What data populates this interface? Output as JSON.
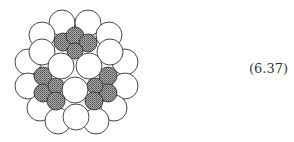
{
  "equation_label": "(6.37)",
  "colors": {
    "white_atom": "#ffffff",
    "stroke": "#333333",
    "hatched_atom": "#8c8c8c"
  },
  "atoms": {
    "outer_white": [
      {
        "cx": 62,
        "cy": 23,
        "r": 13
      },
      {
        "cx": 88,
        "cy": 23,
        "r": 13
      },
      {
        "cx": 42,
        "cy": 35,
        "r": 13
      },
      {
        "cx": 109,
        "cy": 35,
        "r": 13
      },
      {
        "cx": 28,
        "cy": 62,
        "r": 13
      },
      {
        "cx": 125,
        "cy": 62,
        "r": 13
      },
      {
        "cx": 28,
        "cy": 86,
        "r": 13
      },
      {
        "cx": 125,
        "cy": 86,
        "r": 13
      },
      {
        "cx": 40,
        "cy": 108,
        "r": 13
      },
      {
        "cx": 114,
        "cy": 108,
        "r": 13
      },
      {
        "cx": 58,
        "cy": 121,
        "r": 13
      },
      {
        "cx": 96,
        "cy": 121,
        "r": 13
      }
    ],
    "hatched": [
      {
        "cx": 63,
        "cy": 42,
        "r": 9
      },
      {
        "cx": 75,
        "cy": 36,
        "r": 9
      },
      {
        "cx": 88,
        "cy": 43,
        "r": 9
      },
      {
        "cx": 75,
        "cy": 51,
        "r": 8
      },
      {
        "cx": 43,
        "cy": 76,
        "r": 9
      },
      {
        "cx": 43,
        "cy": 93,
        "r": 9
      },
      {
        "cx": 56,
        "cy": 86,
        "r": 8
      },
      {
        "cx": 56,
        "cy": 101,
        "r": 9
      },
      {
        "cx": 108,
        "cy": 76,
        "r": 9
      },
      {
        "cx": 108,
        "cy": 93,
        "r": 9
      },
      {
        "cx": 95,
        "cy": 86,
        "r": 8
      },
      {
        "cx": 94,
        "cy": 101,
        "r": 9
      }
    ],
    "mid_white": [
      {
        "cx": 42,
        "cy": 52,
        "r": 13
      },
      {
        "cx": 110,
        "cy": 52,
        "r": 13
      },
      {
        "cx": 76,
        "cy": 117,
        "r": 13
      }
    ],
    "inner_white": [
      {
        "cx": 61,
        "cy": 66,
        "r": 13
      },
      {
        "cx": 89,
        "cy": 66,
        "r": 13
      },
      {
        "cx": 75,
        "cy": 90,
        "r": 13
      }
    ]
  }
}
